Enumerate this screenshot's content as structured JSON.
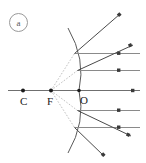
{
  "figure": {
    "panel_label": "a",
    "type": "convex-mirror-ray-diagram",
    "canvas": {
      "width": 146,
      "height": 163,
      "background": "#ffffff"
    },
    "colors": {
      "axis": "#6f6f6f",
      "incident_ray": "#8a8a8a",
      "reflected_ray": "#4a4a4a",
      "mirror": "#5a5a5a",
      "construction": "#b0b0b0",
      "point": "#1a1a1a",
      "label": "#1a1a1a",
      "badge": "#9a9a9a"
    },
    "labels": [
      {
        "name": "center-of-curvature",
        "text": "C",
        "x": 20,
        "y": 96
      },
      {
        "name": "focal-point",
        "text": "F",
        "x": 47,
        "y": 96
      },
      {
        "name": "optical-center",
        "text": "O",
        "x": 80,
        "y": 95
      }
    ],
    "points": [
      {
        "name": "point-C",
        "text": "C",
        "x": 23,
        "y": 90.5
      },
      {
        "name": "point-F",
        "text": "F",
        "x": 51,
        "y": 90.5
      },
      {
        "name": "point-O",
        "text": "O",
        "x": 79,
        "y": 90.5
      }
    ],
    "principal_axis": {
      "x1": 8,
      "y1": 90.5,
      "x2": 140,
      "y2": 90.5
    },
    "mirror": {
      "description": "convex spherical mirror arc, vertex at O, opening toward C",
      "path": "M 68 28 Q 86 59 79 90.5 Q 86 122 68 153",
      "vertex_x": 79,
      "vertex_y": 90.5
    },
    "incident_rays": [
      {
        "name": "incident-ray-1",
        "x1": 140,
        "y1": 53.5,
        "x2": 74.5,
        "y2": 53.5
      },
      {
        "name": "incident-ray-2",
        "x1": 140,
        "y1": 70.5,
        "x2": 77.5,
        "y2": 70.5
      },
      {
        "name": "incident-ray-axis",
        "x1": 140,
        "y1": 90.5,
        "x2": 79,
        "y2": 90.5
      },
      {
        "name": "incident-ray-3",
        "x1": 140,
        "y1": 110.5,
        "x2": 77.5,
        "y2": 110.5
      },
      {
        "name": "incident-ray-4",
        "x1": 140,
        "y1": 127.5,
        "x2": 74.5,
        "y2": 127.5
      }
    ],
    "reflected_rays": [
      {
        "name": "reflected-ray-1",
        "x1": 74.5,
        "y1": 53.5,
        "x2": 120,
        "y2": 14
      },
      {
        "name": "reflected-ray-2",
        "x1": 77.5,
        "y1": 70.5,
        "x2": 133,
        "y2": 45
      },
      {
        "name": "reflected-ray-3",
        "x1": 77.5,
        "y1": 110.5,
        "x2": 131,
        "y2": 136
      },
      {
        "name": "reflected-ray-4",
        "x1": 74.5,
        "y1": 127.5,
        "x2": 104,
        "y2": 156
      }
    ],
    "construction_lines": [
      {
        "name": "virtual-ray-F-1",
        "x1": 51,
        "y1": 90.5,
        "x2": 74.5,
        "y2": 53.5
      },
      {
        "name": "virtual-ray-F-2",
        "x1": 51,
        "y1": 90.5,
        "x2": 77.5,
        "y2": 70.5
      },
      {
        "name": "virtual-ray-F-3",
        "x1": 51,
        "y1": 90.5,
        "x2": 77.5,
        "y2": 110.5
      },
      {
        "name": "virtual-ray-F-4",
        "x1": 51,
        "y1": 90.5,
        "x2": 74.5,
        "y2": 127.5
      }
    ]
  }
}
